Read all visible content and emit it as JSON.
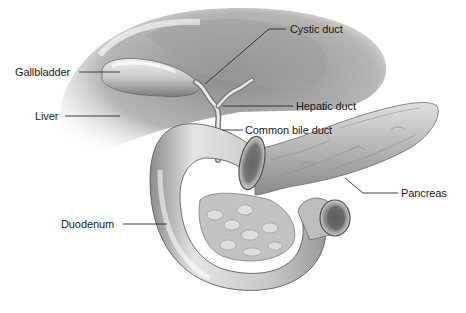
{
  "diagram": {
    "style": "grayscale medical illustration",
    "colors": {
      "background": "#ffffff",
      "label_text": "#1a1a1a",
      "leader_line": "#2a2a2a",
      "organ_light": "#e6e6e6",
      "organ_mid": "#b8b8b8",
      "organ_dark": "#6e6e6e"
    },
    "labels": [
      {
        "id": "gallbladder",
        "text": "Gallbladder",
        "x": 15,
        "y": 66,
        "side": "left"
      },
      {
        "id": "liver",
        "text": "Liver",
        "x": 35,
        "y": 110,
        "side": "left"
      },
      {
        "id": "cystic-duct",
        "text": "Cystic duct",
        "x": 290,
        "y": 24,
        "side": "right"
      },
      {
        "id": "hepatic-duct",
        "text": "Hepatic duct",
        "x": 296,
        "y": 97,
        "side": "right"
      },
      {
        "id": "common-bile-duct",
        "text": "Common bile duct",
        "x": 245,
        "y": 123,
        "side": "right"
      },
      {
        "id": "pancreas",
        "text": "Pancreas",
        "x": 401,
        "y": 186,
        "side": "right"
      },
      {
        "id": "duodenum",
        "text": "Duodenum",
        "x": 61,
        "y": 218,
        "side": "left"
      }
    ]
  }
}
